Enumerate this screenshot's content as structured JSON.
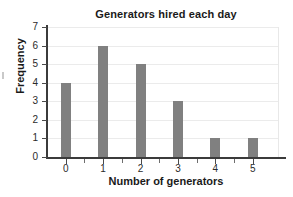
{
  "chart_data": {
    "type": "bar",
    "title": "Generators hired each day",
    "xlabel": "Number of generators",
    "ylabel": "Frequency",
    "categories": [
      "0",
      "1",
      "2",
      "3",
      "4",
      "5"
    ],
    "values": [
      4,
      6,
      5,
      3,
      1,
      1
    ],
    "ylim": [
      0,
      7
    ],
    "y_ticks": [
      "0",
      "1",
      "2",
      "3",
      "4",
      "5",
      "6",
      "7"
    ],
    "xlim": [
      -0.5,
      5.7
    ],
    "grid": "horizontal",
    "legend": "none",
    "bar_color": "#808080",
    "gridline_color": "#ebebeb",
    "axis_color": "#3b3b3b",
    "background_color": "#ffffff",
    "text_color": "#1a1a1a"
  }
}
